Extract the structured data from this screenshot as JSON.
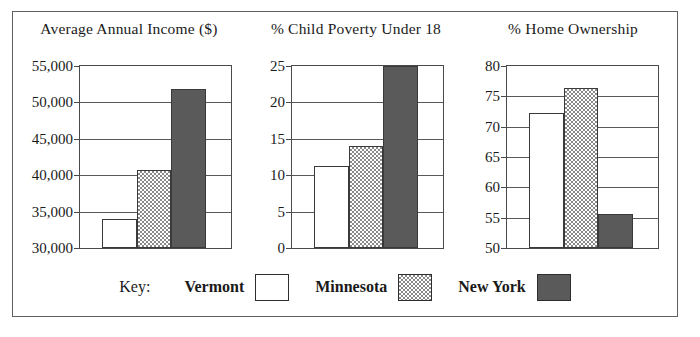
{
  "figure": {
    "border_color": "#5f5f5f"
  },
  "legend": {
    "key_label": "Key:",
    "items": [
      {
        "name": "Vermont",
        "fill": "white",
        "color": "#ffffff"
      },
      {
        "name": "Minnesota",
        "fill": "dotted",
        "color": "#e8e8e8"
      },
      {
        "name": "New York",
        "fill": "dark",
        "color": "#5a5a5a"
      }
    ]
  },
  "chart_data": [
    {
      "type": "bar",
      "title": "Average Annual Income ($)",
      "xlabel": "",
      "ylabel": "",
      "categories": [
        "Vermont",
        "Minnesota",
        "New York"
      ],
      "values": [
        34000,
        40700,
        51900
      ],
      "ylim": [
        30000,
        55000
      ],
      "yticks": [
        30000,
        35000,
        40000,
        45000,
        50000,
        55000
      ],
      "ytick_labels": [
        "30,000",
        "35,000",
        "40,000",
        "45,000",
        "50,000",
        "55,000"
      ],
      "grid": true,
      "legend_position": "bottom"
    },
    {
      "type": "bar",
      "title": "% Child Poverty Under 18",
      "xlabel": "",
      "ylabel": "",
      "categories": [
        "Vermont",
        "Minnesota",
        "New York"
      ],
      "values": [
        11.2,
        14.0,
        25.0
      ],
      "ylim": [
        0,
        25
      ],
      "yticks": [
        0,
        5,
        10,
        15,
        20,
        25
      ],
      "ytick_labels": [
        "0",
        "5",
        "10",
        "15",
        "20",
        "25"
      ],
      "grid": true,
      "legend_position": "bottom"
    },
    {
      "type": "bar",
      "title": "% Home Ownership",
      "xlabel": "",
      "ylabel": "",
      "categories": [
        "Vermont",
        "Minnesota",
        "New York"
      ],
      "values": [
        72.2,
        76.3,
        55.6
      ],
      "ylim": [
        50,
        80
      ],
      "yticks": [
        50,
        55,
        60,
        65,
        70,
        75,
        80
      ],
      "ytick_labels": [
        "50",
        "55",
        "60",
        "65",
        "70",
        "75",
        "80"
      ],
      "grid": true,
      "legend_position": "bottom"
    }
  ]
}
